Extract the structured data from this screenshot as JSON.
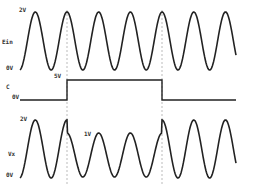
{
  "diagram": {
    "type": "timing-waveform",
    "signals": [
      {
        "name": "Ein",
        "label": "Ein",
        "max_label": "2V",
        "min_label": "0V",
        "shape": "sine",
        "amplitude": "2V"
      },
      {
        "name": "C",
        "label": "C",
        "low_label": "0V",
        "high_label": "5V",
        "shape": "square-pulse"
      },
      {
        "name": "Vx",
        "label": "Vx",
        "max_label": "2V",
        "min_label": "0V",
        "mid_label": "1V",
        "shape": "sine",
        "note": "amplitude reduced to 1V while C is high"
      }
    ]
  },
  "labels": {
    "ein_2v": "2V",
    "ein_name": "Ein",
    "ein_0v": "0V",
    "c_5v": "5V",
    "c_name": "C",
    "c_0v": "0V",
    "vx_2v": "2V",
    "vx_1v": "1V",
    "vx_name": "Vx",
    "vx_0v": "0V"
  },
  "colors": {
    "waveform": "#222222",
    "dashed": "#999999",
    "background": "#ffffff"
  }
}
